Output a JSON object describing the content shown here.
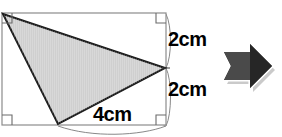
{
  "figure": {
    "shapes": {
      "rectangle": {
        "name": "bounding-rectangle",
        "x": 2,
        "y": 13,
        "width": 164,
        "height": 112,
        "stroke": "#8c8c8c",
        "fill": "#ffffff"
      },
      "triangle": {
        "name": "shaded-triangle",
        "points": "3,14 165,68 58,124",
        "fill": "#cfcfcf",
        "stroke": "#1a1a1a"
      }
    },
    "right_angle_markers": [
      {
        "name": "right-angle-top-left",
        "x": 2,
        "y": 13,
        "corner": "tl"
      },
      {
        "name": "right-angle-top-right",
        "x": 166,
        "y": 13,
        "corner": "tr"
      },
      {
        "name": "right-angle-bottom-left",
        "x": 2,
        "y": 125,
        "corner": "bl"
      },
      {
        "name": "right-angle-bottom-right",
        "x": 166,
        "y": 125,
        "corner": "br"
      }
    ],
    "dimension_labels": [
      {
        "name": "dimension-label-right-top",
        "text": "2cm",
        "value": 2,
        "unit": "cm",
        "edge": "right-upper"
      },
      {
        "name": "dimension-label-right-bottom",
        "text": "2cm",
        "value": 2,
        "unit": "cm",
        "edge": "right-lower"
      },
      {
        "name": "dimension-label-bottom",
        "text": "4cm",
        "value": 4,
        "unit": "cm",
        "edge": "bottom-right"
      }
    ],
    "colors": {
      "rectangle_stroke": "#8c8c8c",
      "triangle_fill": "#cfcfcf",
      "triangle_stroke": "#1a1a1a",
      "label_text": "#000000",
      "brace_stroke": "#6e6e6e",
      "arrow_dark": "#2b2b2b",
      "arrow_mid": "#555555",
      "arrow_light": "#8a8a8a",
      "arrow_outline": "#ffffff",
      "arrow_shadow": "#b4b4b4"
    }
  },
  "arrow": {
    "name": "right-arrow-icon",
    "direction": "right",
    "label": "next"
  }
}
